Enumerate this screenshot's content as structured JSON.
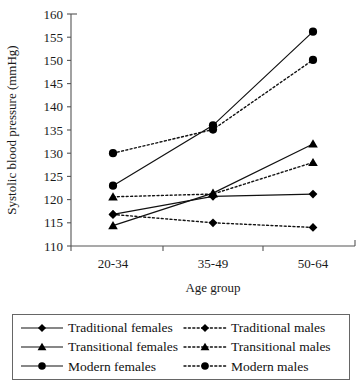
{
  "chart_data": {
    "type": "line",
    "title": "",
    "xlabel": "Age group",
    "ylabel": "Systolic blood pressure (mmHg)",
    "categories": [
      "20-34",
      "35-49",
      "50-64"
    ],
    "ylim": [
      110,
      160
    ],
    "yticks": [
      110,
      115,
      120,
      125,
      130,
      135,
      140,
      145,
      150,
      155,
      160
    ],
    "grid": false,
    "legend_position": "below-plot",
    "series": [
      {
        "name": "Traditional females",
        "values": [
          116.8,
          120.7,
          121.2
        ],
        "marker": "diamond",
        "line_style": "solid",
        "color": "#000000"
      },
      {
        "name": "Traditional males",
        "values": [
          116.8,
          115.0,
          114.0
        ],
        "marker": "diamond",
        "line_style": "dotted",
        "color": "#000000"
      },
      {
        "name": "Transitional females",
        "values": [
          114.4,
          121.4,
          132.0
        ],
        "marker": "triangle",
        "line_style": "solid",
        "color": "#000000"
      },
      {
        "name": "Transitional males",
        "values": [
          120.6,
          121.2,
          128.0
        ],
        "marker": "triangle",
        "line_style": "dotted",
        "color": "#000000"
      },
      {
        "name": "Modern females",
        "values": [
          123.0,
          136.0,
          156.2
        ],
        "marker": "circle",
        "line_style": "solid",
        "color": "#000000"
      },
      {
        "name": "Modern males",
        "values": [
          130.0,
          135.1,
          150.1
        ],
        "marker": "circle",
        "line_style": "dotted",
        "color": "#000000"
      }
    ]
  },
  "axes": {
    "y_tick_labels": [
      "160",
      "155",
      "150",
      "145",
      "140",
      "135",
      "130",
      "125",
      "120",
      "115",
      "110"
    ],
    "x_tick_labels": [
      "20-34",
      "35-49",
      "50-64"
    ],
    "y_axis_title": "Systolic blood pressure (mmHg)",
    "x_axis_title": "Age group"
  },
  "legend": {
    "entries": [
      {
        "label": "Traditional females",
        "marker": "diamond",
        "style": "solid"
      },
      {
        "label": "Traditional males",
        "marker": "diamond",
        "style": "dotted"
      },
      {
        "label": "Transitional females",
        "marker": "triangle",
        "style": "solid"
      },
      {
        "label": "Transitional males",
        "marker": "triangle",
        "style": "dotted"
      },
      {
        "label": "Modern females",
        "marker": "circle",
        "style": "solid"
      },
      {
        "label": "Modern males",
        "marker": "circle",
        "style": "dotted"
      }
    ]
  }
}
